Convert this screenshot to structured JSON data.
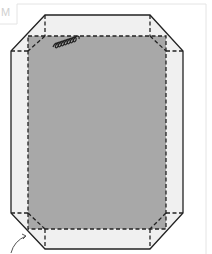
{
  "figure": {
    "label": "M",
    "colors": {
      "panel_fill": "#a8a8a8",
      "flap_fill": "#f0f0f0",
      "outline": "#222222",
      "frame": "#e4e4e4"
    },
    "icons": {
      "coil": "spring-coil-icon",
      "arrow": "curved-arrow-icon"
    }
  }
}
